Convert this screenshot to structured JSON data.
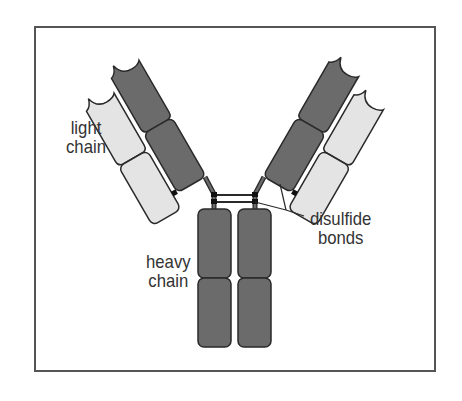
{
  "figure": {
    "colors": {
      "heavy_chain": "#6b6b6b",
      "light_chain": "#e4e4e4",
      "outline": "#2a2a2a",
      "frame": "#555555",
      "background": "#ffffff"
    }
  },
  "labels": {
    "light_chain": {
      "line1": "light",
      "line2": "chain"
    },
    "heavy_chain": {
      "line1": "heavy",
      "line2": "chain"
    },
    "disulfide_bonds": {
      "line1": "disulfide",
      "line2": "bonds"
    }
  }
}
